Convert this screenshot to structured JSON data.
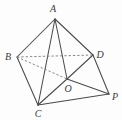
{
  "figure": {
    "canvas": {
      "width": 122,
      "height": 120
    },
    "background_color": "#fdfdfd",
    "stroke_color_solid": "#4a4a4a",
    "stroke_color_dashed": "#7d7d7d",
    "label_color": "#3b3b3b",
    "vertices": [
      {
        "id": "A",
        "label": "A",
        "x": 55,
        "y": 19,
        "label_x": 53,
        "label_y": 9
      },
      {
        "id": "B",
        "label": "B",
        "x": 17,
        "y": 57,
        "label_x": 8,
        "label_y": 57
      },
      {
        "id": "D",
        "label": "D",
        "x": 93,
        "y": 55,
        "label_x": 100,
        "label_y": 55
      },
      {
        "id": "C",
        "label": "C",
        "x": 38,
        "y": 105,
        "label_x": 38,
        "label_y": 114
      },
      {
        "id": "P",
        "label": "P",
        "x": 109,
        "y": 94,
        "label_x": 115,
        "label_y": 97
      },
      {
        "id": "O",
        "label": "O",
        "x": 67,
        "y": 79,
        "label_x": 68,
        "label_y": 89
      }
    ],
    "edges": [
      {
        "from": "A",
        "to": "B",
        "style": "solid",
        "name": "edge-A-B"
      },
      {
        "from": "A",
        "to": "D",
        "style": "solid",
        "name": "edge-A-D"
      },
      {
        "from": "A",
        "to": "C",
        "style": "solid",
        "name": "edge-A-C"
      },
      {
        "from": "A",
        "to": "O",
        "style": "solid",
        "name": "edge-A-O"
      },
      {
        "from": "B",
        "to": "C",
        "style": "solid",
        "name": "edge-B-C"
      },
      {
        "from": "C",
        "to": "O",
        "style": "solid",
        "name": "edge-C-O"
      },
      {
        "from": "C",
        "to": "P",
        "style": "solid",
        "name": "edge-C-P"
      },
      {
        "from": "O",
        "to": "P",
        "style": "solid",
        "name": "edge-O-P"
      },
      {
        "from": "O",
        "to": "D",
        "style": "solid",
        "name": "edge-O-D"
      },
      {
        "from": "D",
        "to": "P",
        "style": "solid",
        "name": "edge-D-P"
      },
      {
        "from": "B",
        "to": "D",
        "style": "dashed",
        "name": "edge-B-D-hidden"
      },
      {
        "from": "B",
        "to": "O",
        "style": "dashed",
        "name": "edge-B-O-hidden"
      }
    ]
  }
}
